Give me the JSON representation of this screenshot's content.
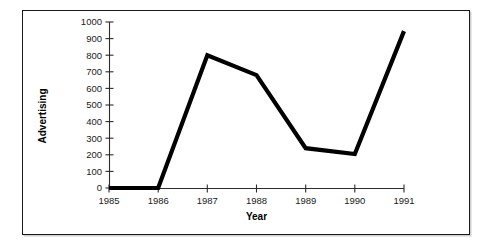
{
  "chart_data": {
    "type": "line",
    "title": "",
    "subtitle": "",
    "xlabel": "Year",
    "ylabel": "Advertising",
    "categories": [
      "1985",
      "1986",
      "1987",
      "1988",
      "1989",
      "1990",
      "1991"
    ],
    "x": [
      1985,
      1986,
      1987,
      1988,
      1989,
      1990,
      1991
    ],
    "values": [
      0,
      0,
      800,
      680,
      240,
      205,
      945
    ],
    "series": [
      {
        "name": "Advertising",
        "values": [
          0,
          0,
          800,
          680,
          240,
          205,
          945
        ],
        "color": "#000000"
      }
    ],
    "xlim": [
      1985,
      1991
    ],
    "ylim": [
      0,
      1000
    ],
    "ytick_labels": [
      "0",
      "100",
      "200",
      "300",
      "400",
      "500",
      "600",
      "700",
      "800",
      "900",
      "1000"
    ],
    "ytick_values": [
      0,
      100,
      200,
      300,
      400,
      500,
      600,
      700,
      800,
      900,
      1000
    ],
    "xtick_labels": [
      "1985",
      "1986",
      "1987",
      "1988",
      "1989",
      "1990",
      "1991"
    ],
    "grid": false,
    "legend": false,
    "legend_position": "none"
  },
  "figure": {
    "border_color": "#1a1a1a",
    "background_color": "#ffffff",
    "line_color": "#000000",
    "axis_color": "#2b2b2b"
  }
}
